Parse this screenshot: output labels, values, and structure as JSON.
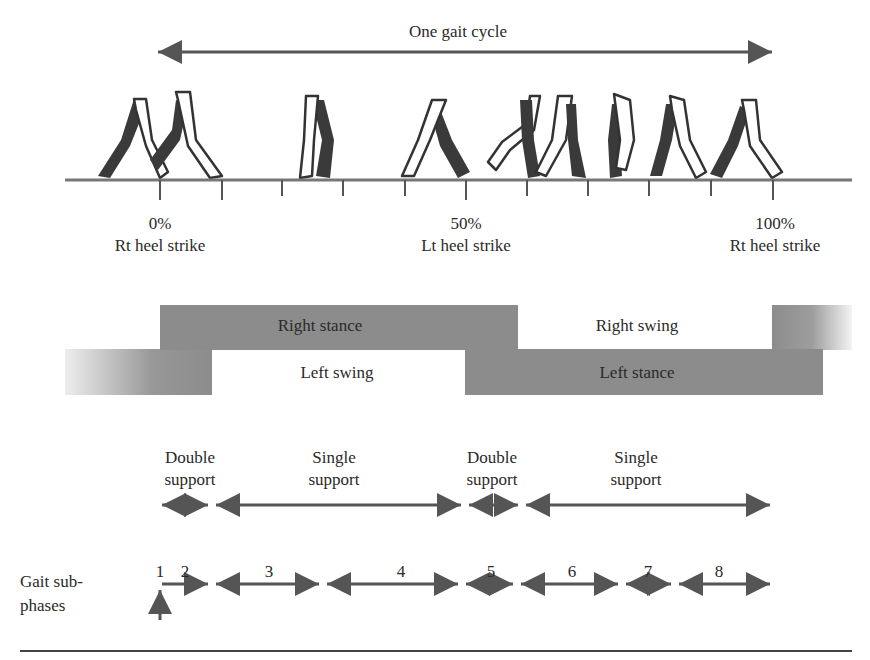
{
  "diagram": {
    "title": "One gait cycle",
    "colors": {
      "bar_fill": "#8c8c8c",
      "line": "#555555",
      "figure_dark": "#3a3a3a",
      "text": "#2a2a2a",
      "background": "#ffffff"
    },
    "events": [
      {
        "percent": "0%",
        "label": "Rt heel strike"
      },
      {
        "percent": "50%",
        "label": "Lt heel strike"
      },
      {
        "percent": "100%",
        "label": "Rt heel strike"
      }
    ],
    "phase_bars": {
      "right_stance": "Right stance",
      "right_swing": "Right swing",
      "left_swing": "Left swing",
      "left_stance": "Left stance"
    },
    "support_phases": [
      {
        "line1": "Double",
        "line2": "support"
      },
      {
        "line1": "Single",
        "line2": "support"
      },
      {
        "line1": "Double",
        "line2": "support"
      },
      {
        "line1": "Single",
        "line2": "support"
      }
    ],
    "subphases": {
      "label_line1": "Gait sub-",
      "label_line2": "phases",
      "numbers": [
        "1",
        "2",
        "3",
        "4",
        "5",
        "6",
        "7",
        "8"
      ]
    },
    "figure_count": 11,
    "tick_count": 11
  }
}
